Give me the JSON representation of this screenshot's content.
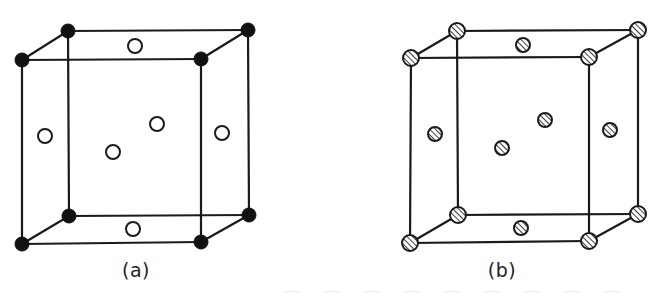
{
  "figure": {
    "type": "crystal-unit-cell-pair",
    "background_color": "#ffffff",
    "line_color": "#1a1a1a",
    "line_width": 2.2,
    "captions": {
      "a": "(a)",
      "b": "(b)"
    }
  },
  "chart_data": {
    "type": "diagram",
    "title": "",
    "subtitle": "",
    "xlabel": "",
    "ylabel": "",
    "panels": [
      {
        "id": "a",
        "label": "(a)",
        "corner_marker": "filled",
        "corner_marker_color": "#111111",
        "corner_marker_radius": 7,
        "interior_marker": "open",
        "interior_marker_color": "#ffffff",
        "interior_marker_stroke": "#1a1a1a",
        "interior_marker_radius": 7,
        "cube": {
          "front_top_left": [
            22,
            60
          ],
          "front_top_right": [
            201,
            59
          ],
          "front_bottom_left": [
            22,
            244
          ],
          "front_bottom_right": [
            201,
            242
          ],
          "back_top_left": [
            68,
            31
          ],
          "back_top_right": [
            248,
            30
          ],
          "back_bottom_left": [
            69,
            216
          ],
          "back_bottom_right": [
            249,
            215
          ]
        },
        "corner_atoms": [
          {
            "name": "front-top-left",
            "x": 22,
            "y": 60
          },
          {
            "name": "front-top-right",
            "x": 201,
            "y": 59
          },
          {
            "name": "front-bottom-left",
            "x": 22,
            "y": 244
          },
          {
            "name": "front-bottom-right",
            "x": 201,
            "y": 242
          },
          {
            "name": "back-top-left",
            "x": 68,
            "y": 31
          },
          {
            "name": "back-top-right",
            "x": 248,
            "y": 30
          },
          {
            "name": "back-bottom-left",
            "x": 69,
            "y": 216
          },
          {
            "name": "back-bottom-right",
            "x": 249,
            "y": 215
          }
        ],
        "interior_atoms": [
          {
            "name": "top-face-centre",
            "x": 135,
            "y": 46
          },
          {
            "name": "left-face-centre",
            "x": 45,
            "y": 136
          },
          {
            "name": "body-centre",
            "x": 113,
            "y": 152
          },
          {
            "name": "back-face-centre",
            "x": 157,
            "y": 124
          },
          {
            "name": "right-face-centre",
            "x": 222,
            "y": 133
          },
          {
            "name": "bottom-face-centre",
            "x": 133,
            "y": 229
          }
        ]
      },
      {
        "id": "b",
        "label": "(b)",
        "corner_marker": "hatched",
        "corner_marker_color": "#ffffff",
        "corner_marker_stroke": "#1a1a1a",
        "corner_marker_radius": 8,
        "interior_marker": "hatched",
        "interior_marker_color": "#ffffff",
        "interior_marker_stroke": "#1a1a1a",
        "interior_marker_radius": 7,
        "hatch_angle_deg": 45,
        "cube": {
          "front_top_left": [
            411,
            58
          ],
          "front_top_right": [
            589,
            57
          ],
          "front_bottom_left": [
            410,
            243
          ],
          "front_bottom_right": [
            589,
            241
          ],
          "back_top_left": [
            457,
            31
          ],
          "back_top_right": [
            638,
            30
          ],
          "back_bottom_left": [
            458,
            215
          ],
          "back_bottom_right": [
            638,
            214
          ]
        },
        "corner_atoms": [
          {
            "name": "front-top-left",
            "x": 411,
            "y": 58
          },
          {
            "name": "front-top-right",
            "x": 589,
            "y": 57
          },
          {
            "name": "front-bottom-left",
            "x": 410,
            "y": 243
          },
          {
            "name": "front-bottom-right",
            "x": 589,
            "y": 241
          },
          {
            "name": "back-top-left",
            "x": 457,
            "y": 31
          },
          {
            "name": "back-top-right",
            "x": 638,
            "y": 30
          },
          {
            "name": "back-bottom-left",
            "x": 458,
            "y": 215
          },
          {
            "name": "back-bottom-right",
            "x": 638,
            "y": 214
          }
        ],
        "interior_atoms": [
          {
            "name": "top-face-centre",
            "x": 523,
            "y": 45
          },
          {
            "name": "left-face-centre",
            "x": 435,
            "y": 134
          },
          {
            "name": "body-centre",
            "x": 502,
            "y": 148
          },
          {
            "name": "back-face-centre",
            "x": 545,
            "y": 120
          },
          {
            "name": "right-face-centre",
            "x": 610,
            "y": 130
          },
          {
            "name": "bottom-face-centre",
            "x": 521,
            "y": 228
          }
        ]
      }
    ]
  }
}
